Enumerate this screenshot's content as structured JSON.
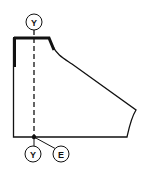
{
  "diagram": {
    "type": "sewing-pattern-piece",
    "colors": {
      "stroke": "#111111",
      "background": "#ffffff"
    },
    "markers": [
      {
        "id": "top-marker",
        "label": "Y"
      },
      {
        "id": "bottom-marker-left",
        "label": "Y"
      },
      {
        "id": "bottom-marker-right",
        "label": "E"
      }
    ],
    "lines": {
      "grainline": "dashed",
      "emphasized_edges": [
        "neckline-top",
        "left-upper-edge"
      ]
    }
  }
}
